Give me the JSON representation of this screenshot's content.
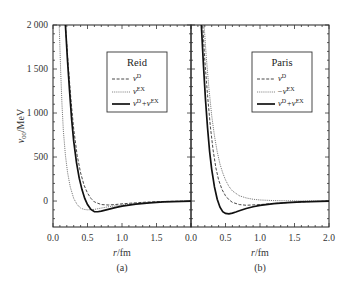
{
  "chart_data": [
    {
      "type": "line",
      "panel_label": "(a)",
      "title": "Reid",
      "xlabel": "r/fm",
      "ylabel": "v_00/MeV",
      "xlim": [
        0.0,
        2.0
      ],
      "ylim": [
        -300,
        2000
      ],
      "xticks": [
        "0.0",
        "0.5",
        "1.0",
        "1.5"
      ],
      "yticks": [
        "2 000",
        "1 500",
        "1 000",
        "500",
        "0"
      ],
      "legend_position": "upper right",
      "series": [
        {
          "name": "v^D",
          "style": "dashed",
          "x": [
            0.18,
            0.22,
            0.26,
            0.3,
            0.35,
            0.4,
            0.45,
            0.5,
            0.55,
            0.6,
            0.7,
            0.8,
            0.9,
            1.0,
            1.2,
            1.4,
            1.6,
            2.0
          ],
          "y": [
            2000,
            1550,
            1150,
            820,
            520,
            320,
            180,
            90,
            30,
            -10,
            -40,
            -45,
            -40,
            -32,
            -20,
            -10,
            -5,
            0
          ]
        },
        {
          "name": "v^EX",
          "style": "dotted",
          "x": [
            0.09,
            0.11,
            0.13,
            0.15,
            0.18,
            0.21,
            0.25,
            0.3,
            0.35,
            0.4,
            0.45,
            0.5,
            0.6,
            0.7,
            0.8,
            1.0,
            1.2,
            1.5,
            2.0
          ],
          "y": [
            2000,
            1500,
            1100,
            800,
            520,
            330,
            160,
            30,
            -40,
            -80,
            -95,
            -100,
            -95,
            -80,
            -65,
            -45,
            -28,
            -12,
            0
          ]
        },
        {
          "name": "v^D+v^EX",
          "style": "solid",
          "x": [
            0.18,
            0.21,
            0.24,
            0.27,
            0.3,
            0.34,
            0.38,
            0.42,
            0.46,
            0.5,
            0.55,
            0.6,
            0.65,
            0.7,
            0.8,
            0.9,
            1.0,
            1.2,
            1.4,
            1.6,
            2.0
          ],
          "y": [
            2000,
            1600,
            1250,
            930,
            680,
            440,
            260,
            130,
            30,
            -40,
            -95,
            -120,
            -122,
            -115,
            -95,
            -75,
            -58,
            -35,
            -20,
            -10,
            0
          ]
        }
      ]
    },
    {
      "type": "line",
      "panel_label": "(b)",
      "title": "Paris",
      "xlabel": "r/fm",
      "ylabel": "v_00/MeV",
      "xlim": [
        0.0,
        2.0
      ],
      "ylim": [
        -300,
        2000
      ],
      "xticks": [
        "0.0",
        "0.5",
        "1.0",
        "1.5",
        "2.0"
      ],
      "yticks": [
        "2 000",
        "1 500",
        "1 000",
        "500",
        "0"
      ],
      "legend_position": "upper right",
      "series": [
        {
          "name": "v^D",
          "style": "dashed",
          "x": [
            0.17,
            0.2,
            0.24,
            0.28,
            0.32,
            0.36,
            0.4,
            0.45,
            0.5,
            0.55,
            0.6,
            0.7,
            0.8,
            1.0,
            1.2,
            1.5,
            2.0
          ],
          "y": [
            2000,
            1600,
            1200,
            850,
            580,
            380,
            240,
            130,
            60,
            15,
            -15,
            -40,
            -48,
            -40,
            -28,
            -12,
            0
          ]
        },
        {
          "name": "-v^EX",
          "style": "dotted",
          "x": [
            0.19,
            0.22,
            0.26,
            0.3,
            0.34,
            0.38,
            0.42,
            0.46,
            0.5,
            0.55,
            0.6,
            0.7,
            0.8,
            0.9,
            1.0,
            1.2,
            1.5,
            2.0
          ],
          "y": [
            2000,
            1650,
            1280,
            970,
            740,
            560,
            420,
            320,
            240,
            165,
            115,
            60,
            35,
            20,
            12,
            5,
            2,
            0
          ]
        },
        {
          "name": "v^D+v^EX",
          "style": "solid",
          "x": [
            0.15,
            0.18,
            0.21,
            0.24,
            0.27,
            0.3,
            0.34,
            0.38,
            0.42,
            0.46,
            0.5,
            0.55,
            0.6,
            0.65,
            0.7,
            0.8,
            0.9,
            1.0,
            1.2,
            1.4,
            1.6,
            2.0
          ],
          "y": [
            2000,
            1550,
            1150,
            830,
            560,
            360,
            160,
            20,
            -70,
            -120,
            -140,
            -145,
            -138,
            -125,
            -110,
            -85,
            -65,
            -50,
            -30,
            -18,
            -10,
            0
          ]
        }
      ]
    }
  ],
  "panels": {
    "a": {
      "label": "(a)",
      "legend_title": "Reid",
      "legend": [
        {
          "base": "v",
          "sup": "D"
        },
        {
          "base": "v",
          "sup": "EX"
        },
        {
          "base": "v",
          "sup": "D",
          "plus_base": "+v",
          "plus_sup": "EX"
        }
      ]
    },
    "b": {
      "label": "(b)",
      "legend_title": "Paris",
      "legend": [
        {
          "base": "v",
          "sup": "D"
        },
        {
          "base": "−v",
          "sup": "EX"
        },
        {
          "base": "v",
          "sup": "D",
          "plus_base": "+v",
          "plus_sup": "EX"
        }
      ]
    }
  },
  "axes": {
    "ylabel_main": "v",
    "ylabel_sub": "00",
    "ylabel_unit": "/MeV",
    "xlabel_r": "r",
    "xlabel_unit": "/fm",
    "yticks": [
      "2 000",
      "1 500",
      "1 000",
      "500",
      "0"
    ],
    "xticks_a": [
      "0.0",
      "0.5",
      "1.0",
      "1.5"
    ],
    "xticks_b": [
      "0.0",
      "0.5",
      "1.0",
      "1.5",
      "2.0"
    ]
  }
}
